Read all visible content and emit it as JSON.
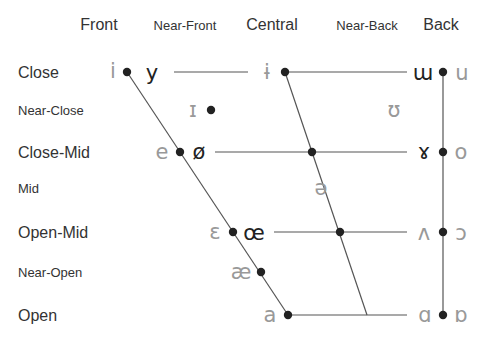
{
  "columns": [
    {
      "label": "Front",
      "x": 99,
      "size": 16
    },
    {
      "label": "Near-Front",
      "x": 185,
      "size": 13
    },
    {
      "label": "Central",
      "x": 272,
      "size": 16
    },
    {
      "label": "Near-Back",
      "x": 367,
      "size": 13
    },
    {
      "label": "Back",
      "x": 441,
      "size": 16
    }
  ],
  "rows": [
    {
      "label": "Close",
      "y": 78,
      "size": 16
    },
    {
      "label": "Near-Close",
      "y": 115,
      "size": 13
    },
    {
      "label": "Close-Mid",
      "y": 158,
      "size": 16
    },
    {
      "label": "Mid",
      "y": 193,
      "size": 13
    },
    {
      "label": "Open-Mid",
      "y": 238,
      "size": 16
    },
    {
      "label": "Near-Open",
      "y": 277,
      "size": 13
    },
    {
      "label": "Open",
      "y": 321,
      "size": 16
    }
  ],
  "vowels": [
    {
      "symbol": "i",
      "x": 113,
      "y": 78,
      "rounded": false
    },
    {
      "symbol": "y",
      "x": 152,
      "y": 80,
      "rounded": true
    },
    {
      "symbol": "ɨ",
      "x": 267,
      "y": 79,
      "rounded": false
    },
    {
      "symbol": "ɯ",
      "x": 423,
      "y": 80,
      "rounded": true
    },
    {
      "symbol": "u",
      "x": 462,
      "y": 80,
      "rounded": false
    },
    {
      "symbol": "ɪ",
      "x": 193,
      "y": 117,
      "rounded": false
    },
    {
      "symbol": "ʊ",
      "x": 394,
      "y": 117,
      "rounded": false
    },
    {
      "symbol": "e",
      "x": 162,
      "y": 159,
      "rounded": false
    },
    {
      "symbol": "ø",
      "x": 199,
      "y": 159,
      "rounded": true
    },
    {
      "symbol": "ɤ",
      "x": 424,
      "y": 159,
      "rounded": true
    },
    {
      "symbol": "o",
      "x": 461,
      "y": 159,
      "rounded": false
    },
    {
      "symbol": "ə",
      "x": 321,
      "y": 195,
      "rounded": false
    },
    {
      "symbol": "ɛ",
      "x": 215,
      "y": 239,
      "rounded": false
    },
    {
      "symbol": "œ",
      "x": 254,
      "y": 240,
      "rounded": true
    },
    {
      "symbol": "ʌ",
      "x": 424,
      "y": 240,
      "rounded": false
    },
    {
      "symbol": "ɔ",
      "x": 461,
      "y": 240,
      "rounded": false
    },
    {
      "symbol": "æ",
      "x": 241,
      "y": 279,
      "rounded": false
    },
    {
      "symbol": "a",
      "x": 270,
      "y": 322,
      "rounded": false
    },
    {
      "symbol": "ɑ",
      "x": 425,
      "y": 322,
      "rounded": false
    },
    {
      "symbol": "ɒ",
      "x": 461,
      "y": 322,
      "rounded": false
    }
  ],
  "dots": [
    {
      "x": 127,
      "y": 72
    },
    {
      "x": 285,
      "y": 72
    },
    {
      "x": 443,
      "y": 72
    },
    {
      "x": 211,
      "y": 110
    },
    {
      "x": 180,
      "y": 152
    },
    {
      "x": 312,
      "y": 152
    },
    {
      "x": 443,
      "y": 152
    },
    {
      "x": 233,
      "y": 232
    },
    {
      "x": 340,
      "y": 232
    },
    {
      "x": 443,
      "y": 232
    },
    {
      "x": 261,
      "y": 272
    },
    {
      "x": 288,
      "y": 315
    },
    {
      "x": 443,
      "y": 315
    }
  ],
  "lines": [
    {
      "x1": 127,
      "y1": 72,
      "x2": 288,
      "y2": 315
    },
    {
      "x1": 285,
      "y1": 72,
      "x2": 367,
      "y2": 315
    },
    {
      "x1": 443,
      "y1": 72,
      "x2": 443,
      "y2": 315
    },
    {
      "x1": 174,
      "y1": 72,
      "x2": 248,
      "y2": 72
    },
    {
      "x1": 285,
      "y1": 72,
      "x2": 407,
      "y2": 72
    },
    {
      "x1": 215,
      "y1": 152,
      "x2": 407,
      "y2": 152
    },
    {
      "x1": 274,
      "y1": 232,
      "x2": 407,
      "y2": 232
    },
    {
      "x1": 288,
      "y1": 315,
      "x2": 407,
      "y2": 315
    }
  ],
  "colors": {
    "unrounded": "#999999",
    "rounded": "#222222",
    "line": "#555555",
    "dot": "#222222"
  }
}
